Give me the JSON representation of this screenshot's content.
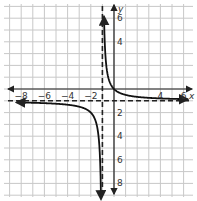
{
  "chart_data": {
    "type": "line",
    "title": "",
    "xlabel": "x",
    "ylabel": "y",
    "xlim": [
      -8.5,
      6.5
    ],
    "ylim": [
      -8.5,
      6.5
    ],
    "grid": true,
    "x_ticks": [
      -8,
      -6,
      -4,
      -2,
      4,
      6
    ],
    "y_ticks": [
      6,
      4,
      -2,
      -4,
      -6,
      -8
    ],
    "x_tick_labels": [
      "−8",
      "−6",
      "−4",
      "−2",
      "4",
      "6"
    ],
    "y_tick_labels": [
      "6",
      "4",
      "2",
      "4",
      "6",
      "8"
    ],
    "asymptotes": {
      "vertical": {
        "x": -1,
        "style": "dashed"
      },
      "horizontal": {
        "y": -1,
        "style": "dashed"
      }
    },
    "series": [
      {
        "name": "y = 1/(x+1) - 1",
        "branch": "right",
        "x": [
          -0.86,
          -0.8,
          -0.7,
          -0.5,
          -0.25,
          0,
          0.5,
          1,
          2,
          3,
          4,
          5,
          6.3
        ],
        "y": [
          6.1,
          4,
          2.33,
          1,
          0.33,
          0,
          -0.33,
          -0.5,
          -0.67,
          -0.75,
          -0.8,
          -0.83,
          -0.86
        ]
      },
      {
        "name": "y = 1/(x+1) - 1",
        "branch": "left",
        "x": [
          -8.3,
          -7,
          -6,
          -5,
          -4,
          -3,
          -2.5,
          -2,
          -1.5,
          -1.25,
          -1.15,
          -1.125
        ],
        "y": [
          -1.14,
          -1.17,
          -1.2,
          -1.25,
          -1.33,
          -1.5,
          -1.67,
          -2,
          -3,
          -5,
          -7.67,
          -9
        ]
      }
    ]
  },
  "labels": {
    "x_axis": "x",
    "y_axis": "y"
  }
}
